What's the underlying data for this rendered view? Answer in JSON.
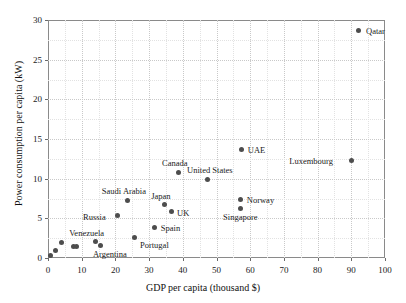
{
  "chart_data": {
    "type": "scatter",
    "title": "",
    "xlabel": "GDP per capita (thousand $)",
    "ylabel": "Power consumption per capita (kW)",
    "xlim": [
      0,
      100
    ],
    "ylim": [
      0,
      30
    ],
    "xticks": [
      "0",
      "10",
      "20",
      "30",
      "40",
      "50",
      "60",
      "70",
      "80",
      "90",
      "100"
    ],
    "yticks": [
      "0",
      "5",
      "10",
      "15",
      "20",
      "25",
      "30"
    ],
    "grid": true,
    "legend": "none",
    "marker_color": "#4d4d4d",
    "points": [
      {
        "label": "Qatar",
        "x": 92.0,
        "y": 28.7,
        "lx": 8,
        "ly": -3
      },
      {
        "label": "UAE",
        "x": 57.5,
        "y": 13.7,
        "lx": 6,
        "ly": -3
      },
      {
        "label": "Luxembourg",
        "x": 90.0,
        "y": 12.3,
        "lx": -62,
        "ly": -3
      },
      {
        "label": "Canada",
        "x": 38.6,
        "y": 10.8,
        "lx": -16,
        "ly": -13
      },
      {
        "label": "United States",
        "x": 47.2,
        "y": 9.9,
        "lx": -20,
        "ly": -13
      },
      {
        "label": "Norway",
        "x": 57.2,
        "y": 7.4,
        "lx": 6,
        "ly": -3
      },
      {
        "label": "Saudi Arabia",
        "x": 23.7,
        "y": 7.3,
        "lx": -26,
        "ly": -13
      },
      {
        "label": "Japan",
        "x": 34.5,
        "y": 6.7,
        "lx": -13,
        "ly": -13
      },
      {
        "label": "Singapore",
        "x": 57.0,
        "y": 6.3,
        "lx": -17,
        "ly": 5
      },
      {
        "label": "UK",
        "x": 36.5,
        "y": 5.8,
        "lx": 6,
        "ly": -3
      },
      {
        "label": "Russia",
        "x": 20.5,
        "y": 5.3,
        "lx": -34,
        "ly": -3
      },
      {
        "label": "Spain",
        "x": 31.7,
        "y": 3.9,
        "lx": 6,
        "ly": -3
      },
      {
        "label": "Portugal",
        "x": 25.8,
        "y": 2.6,
        "lx": 5,
        "ly": 4
      },
      {
        "label": "Venezuela",
        "x": 14.0,
        "y": 2.1,
        "lx": -26,
        "ly": -12
      },
      {
        "label": "Argentina",
        "x": 15.7,
        "y": 1.6,
        "lx": -8,
        "ly": 5
      },
      {
        "label": "",
        "x": 0.6,
        "y": 0.3,
        "lx": 0,
        "ly": 0
      },
      {
        "label": "",
        "x": 2.2,
        "y": 0.9,
        "lx": 0,
        "ly": 0
      },
      {
        "label": "",
        "x": 4.0,
        "y": 1.9,
        "lx": 0,
        "ly": 0
      },
      {
        "label": "",
        "x": 7.6,
        "y": 1.5,
        "lx": 0,
        "ly": 0
      },
      {
        "label": "",
        "x": 8.6,
        "y": 1.5,
        "lx": 0,
        "ly": 0
      }
    ]
  }
}
